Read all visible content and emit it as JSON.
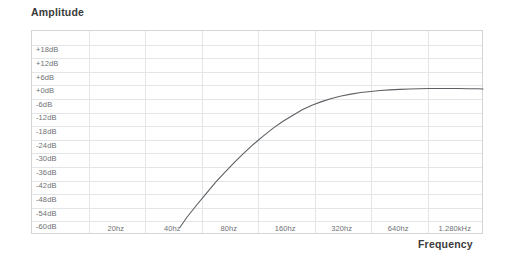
{
  "axes": {
    "y_title": "Amplitude",
    "x_title": "Frequency"
  },
  "chart_data": {
    "type": "line",
    "title": "Amplitude",
    "xlabel": "Frequency",
    "ylabel": "Amplitude",
    "grid": true,
    "legend": false,
    "line_color": "#5d6064",
    "grid_color": "#e3e5e7",
    "frame_color": "#d2d4d6",
    "background": "#ffffff",
    "y_ticks": [
      "+18dB",
      "+12dB",
      "+6dB",
      "+0dB",
      "-6dB",
      "-12dB",
      "-18dB",
      "-24dB",
      "-30dB",
      "-36dB",
      "-42dB",
      "-48dB",
      "-54dB",
      "-60dB"
    ],
    "y_tick_values": [
      18,
      12,
      6,
      0,
      -6,
      -12,
      -18,
      -24,
      -30,
      -36,
      -42,
      -48,
      -54,
      -60
    ],
    "ylim": [
      -60,
      24
    ],
    "x_ticks": [
      "20hz",
      "40hz",
      "80hz",
      "160hz",
      "320hz",
      "640hz",
      "1.280kHz"
    ],
    "x_tick_values": [
      20,
      40,
      80,
      160,
      320,
      640,
      1280
    ],
    "xlim": [
      10,
      1810
    ],
    "x_scale": "log2-octave",
    "series": [
      {
        "name": "High-pass filter response",
        "x": [
          44,
          48,
          54,
          60,
          68,
          76,
          86,
          96,
          108,
          122,
          138,
          155,
          175,
          197,
          222,
          250,
          282,
          318,
          358,
          404,
          455,
          513,
          578,
          652,
          735,
          828,
          934,
          1053,
          1187,
          1338,
          1510,
          1700,
          1810
        ],
        "y": [
          -60.0,
          -55.5,
          -50.2,
          -45.6,
          -40.2,
          -35.9,
          -31.3,
          -27.4,
          -23.5,
          -19.8,
          -16.3,
          -13.4,
          -10.7,
          -8.2,
          -6.2,
          -4.6,
          -3.2,
          -2.1,
          -1.3,
          -0.6,
          -0.1,
          0.3,
          0.6,
          0.8,
          1.0,
          1.1,
          1.2,
          1.2,
          1.2,
          1.2,
          1.1,
          1.1,
          1.0
        ]
      }
    ]
  }
}
